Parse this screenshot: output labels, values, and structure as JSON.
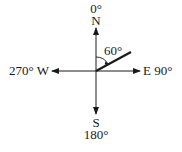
{
  "diagram": {
    "type": "compass-bearing",
    "center": {
      "x": 96,
      "y": 71
    },
    "labels": {
      "north_deg": "0°",
      "north": "N",
      "east": "E 90°",
      "south": "S",
      "south_deg": "180°",
      "west": "270° W",
      "angle": "60°"
    },
    "bearing_degrees": 60,
    "colors": {
      "line": "#1a1a1a",
      "background": "#ffffff"
    }
  }
}
